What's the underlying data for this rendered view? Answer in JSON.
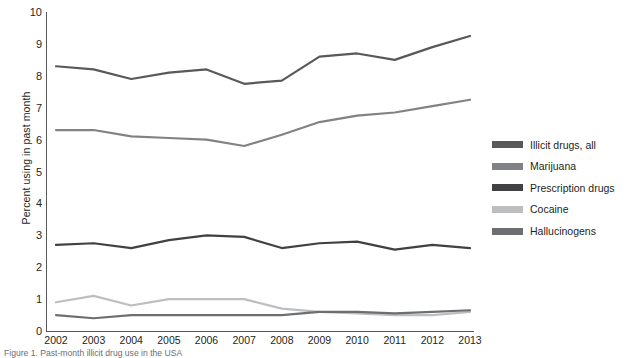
{
  "chart_data": {
    "type": "line",
    "title": "",
    "xlabel": "",
    "ylabel": "Percent using in past month",
    "categories": [
      "2002",
      "2003",
      "2004",
      "2005",
      "2006",
      "2007",
      "2008",
      "2009",
      "2010",
      "2011",
      "2012",
      "2013"
    ],
    "xlim": [
      2002,
      2013
    ],
    "ylim": [
      0,
      10
    ],
    "yticks": [
      0,
      1,
      2,
      3,
      4,
      5,
      6,
      7,
      8,
      9,
      10
    ],
    "grid": false,
    "legend_position": "right",
    "series": [
      {
        "name": "Illicit drugs, all",
        "color": "#58595b",
        "values": [
          8.3,
          8.2,
          7.9,
          8.1,
          8.2,
          7.75,
          7.85,
          8.6,
          8.7,
          8.5,
          8.9,
          9.25
        ]
      },
      {
        "name": "Marijuana",
        "color": "#808285",
        "values": [
          6.3,
          6.3,
          6.1,
          6.05,
          6.0,
          5.8,
          6.15,
          6.55,
          6.75,
          6.85,
          7.05,
          7.25
        ]
      },
      {
        "name": "Prescription drugs",
        "color": "#414042",
        "values": [
          2.7,
          2.75,
          2.6,
          2.85,
          3.0,
          2.95,
          2.6,
          2.75,
          2.8,
          2.55,
          2.7,
          2.6
        ]
      },
      {
        "name": "Cocaine",
        "color": "#bcbec0",
        "values": [
          0.9,
          1.1,
          0.8,
          1.0,
          1.0,
          1.0,
          0.7,
          0.6,
          0.55,
          0.5,
          0.5,
          0.6
        ]
      },
      {
        "name": "Hallucinogens",
        "color": "#6d6e71",
        "values": [
          0.5,
          0.4,
          0.5,
          0.5,
          0.5,
          0.5,
          0.5,
          0.6,
          0.6,
          0.55,
          0.6,
          0.65
        ]
      }
    ]
  },
  "axis": {
    "y_title": "Percent using in past month",
    "y_tick_labels": [
      "10",
      "9",
      "8",
      "7",
      "6",
      "5",
      "4",
      "3",
      "2",
      "1",
      "0"
    ],
    "x_tick_labels": [
      "2002",
      "2003",
      "2004",
      "2005",
      "2006",
      "2007",
      "2008",
      "2009",
      "2010",
      "2011",
      "2012",
      "2013"
    ]
  },
  "legend": {
    "items": [
      {
        "label": "Illicit drugs, all",
        "color": "#58595b"
      },
      {
        "label": "Marijuana",
        "color": "#808285"
      },
      {
        "label": "Prescription drugs",
        "color": "#414042"
      },
      {
        "label": "Cocaine",
        "color": "#bcbec0"
      },
      {
        "label": "Hallucinogens",
        "color": "#6d6e71"
      }
    ]
  },
  "caption": {
    "text": "Figure 1. Past-month illicit drug use in the USA"
  },
  "colors": {
    "axis": "#58595b",
    "text": "#231f20",
    "background": "#ffffff"
  }
}
